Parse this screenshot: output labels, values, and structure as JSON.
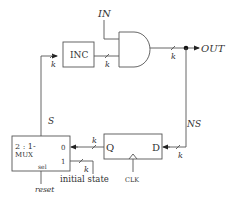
{
  "labels": {
    "in": "IN",
    "out": "OUT",
    "inc": "INC",
    "s": "S",
    "ns": "NS",
    "k": "k",
    "mux_line1": "2 : 1-",
    "mux_line2": "MUX",
    "mux_in0": "0",
    "mux_in1": "1",
    "mux_sel": "sel",
    "reset": "reset",
    "initial_state": "initial state",
    "reg_q": "Q",
    "reg_d": "D",
    "clk": "CLK"
  },
  "colors": {
    "line": "#555555",
    "text": "#333333",
    "background": "#ffffff"
  }
}
